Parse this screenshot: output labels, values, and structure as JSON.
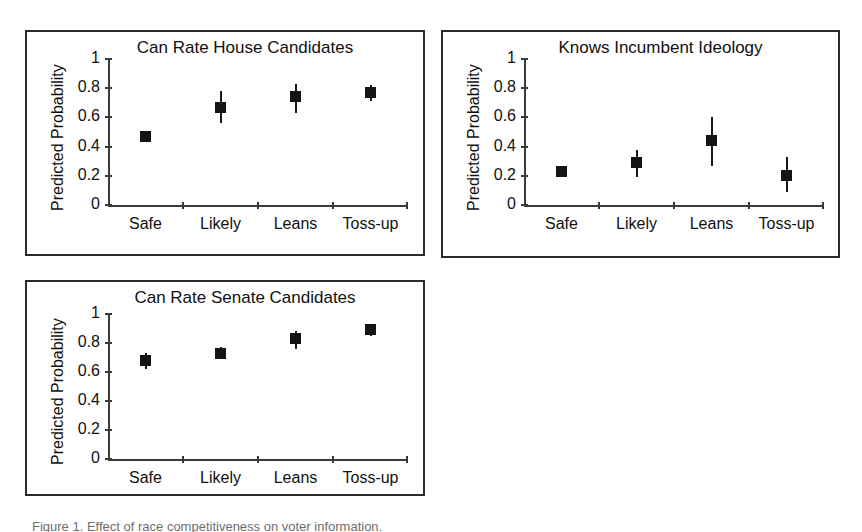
{
  "figure": {
    "caption": "Figure 1.  Effect of race competitiveness on voter information.",
    "background_color": "#ffffff",
    "marker_color": "#141414",
    "axis_color": "#3a3a3a",
    "border_color": "#2b2b2b"
  },
  "axis": {
    "ylabel": "Predicted Probability",
    "ytick_labels": [
      "1",
      "0.8",
      "0.6",
      "0.4",
      "0.2",
      "0"
    ],
    "ytick_values": [
      1,
      0.8,
      0.6,
      0.4,
      0.2,
      0
    ],
    "xtick_labels": [
      "Safe",
      "Likely",
      "Leans",
      "Toss-up"
    ]
  },
  "chart_data": [
    {
      "type": "scatter",
      "title": "Can Rate House Candidates",
      "xlabel": "",
      "ylabel": "Predicted Probability",
      "categories": [
        "Safe",
        "Likely",
        "Leans",
        "Toss-up"
      ],
      "values": [
        0.47,
        0.67,
        0.74,
        0.77
      ],
      "ci_lower": [
        0.43,
        0.56,
        0.63,
        0.71
      ],
      "ci_upper": [
        0.51,
        0.78,
        0.83,
        0.82
      ],
      "ylim": [
        0,
        1
      ],
      "ytick_interval": 0.2,
      "grid": false,
      "legend": "none",
      "error_bars": "95% confidence interval"
    },
    {
      "type": "scatter",
      "title": "Knows Incumbent Ideology",
      "xlabel": "",
      "ylabel": "Predicted Probability",
      "categories": [
        "Safe",
        "Likely",
        "Leans",
        "Toss-up"
      ],
      "values": [
        0.23,
        0.29,
        0.44,
        0.2
      ],
      "ci_lower": [
        0.19,
        0.19,
        0.27,
        0.09
      ],
      "ci_upper": [
        0.27,
        0.38,
        0.6,
        0.33
      ],
      "ylim": [
        0,
        1
      ],
      "ytick_interval": 0.2,
      "grid": false,
      "legend": "none",
      "error_bars": "95% confidence interval"
    },
    {
      "type": "scatter",
      "title": "Can Rate Senate Candidates",
      "xlabel": "",
      "ylabel": "Predicted Probability",
      "categories": [
        "Safe",
        "Likely",
        "Leans",
        "Toss-up"
      ],
      "values": [
        0.68,
        0.73,
        0.83,
        0.89
      ],
      "ci_lower": [
        0.62,
        0.7,
        0.76,
        0.85
      ],
      "ci_upper": [
        0.73,
        0.77,
        0.88,
        0.93
      ],
      "ylim": [
        0,
        1
      ],
      "ytick_interval": 0.2,
      "grid": false,
      "legend": "none",
      "error_bars": "95% confidence interval"
    }
  ]
}
